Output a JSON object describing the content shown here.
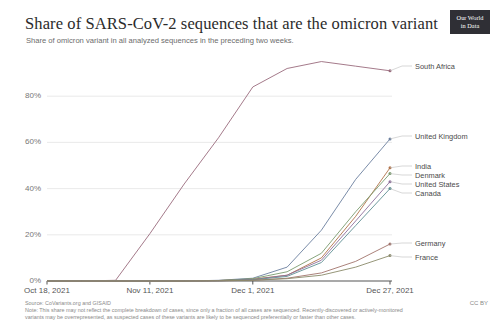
{
  "header": {
    "title": "Share of SARS-CoV-2 sequences that are the omicron variant",
    "subtitle": "Share of omicron variant in all analyzed sequences in the preceding two weeks.",
    "logo_line1": "Our World",
    "logo_line2": "in Data"
  },
  "footer": {
    "source": "Source: CoVariants.org and GISAID",
    "note": "Note: This share may not reflect the complete breakdown of cases, since only a fraction of all cases are sequenced. Recently-discovered or actively-monitored variants may be overrepresented, as suspected cases of these variants are likely to be sequenced preferentially or faster than other cases.",
    "license": "CC BY"
  },
  "chart_data": {
    "type": "line",
    "title": "Share of SARS-CoV-2 sequences that are the omicron variant",
    "subtitle": "Share of omicron variant in all analyzed sequences in the preceding two weeks.",
    "xlabel": "",
    "ylabel": "",
    "ylim": [
      0,
      100
    ],
    "yticks": [
      0,
      20,
      40,
      60,
      80
    ],
    "ytick_labels": [
      "0%",
      "20%",
      "40%",
      "60%",
      "80%"
    ],
    "grid": true,
    "legend_position": "right-inline",
    "x": [
      "Oct 18, 2021",
      "Oct 25, 2021",
      "Nov 1, 2021",
      "Nov 11, 2021",
      "Nov 18, 2021",
      "Nov 25, 2021",
      "Dec 1, 2021",
      "Dec 7, 2021",
      "Dec 13, 2021",
      "Dec 20, 2021",
      "Dec 27, 2021"
    ],
    "xtick_labels": [
      "Oct 18, 2021",
      "Nov 11, 2021",
      "Dec 1, 2021",
      "Dec 27, 2021"
    ],
    "xtick_positions": [
      0,
      3,
      6,
      10
    ],
    "series": [
      {
        "name": "South Africa",
        "color": "#9a6b7d",
        "values": [
          0,
          0,
          0.3,
          20.5,
          42,
          62,
          84,
          92,
          95,
          93,
          91
        ]
      },
      {
        "name": "United Kingdom",
        "color": "#6b7f9e",
        "values": [
          0,
          0,
          0,
          0,
          0,
          0.3,
          1.2,
          6,
          22,
          44,
          61.5
        ]
      },
      {
        "name": "India",
        "color": "#b0734a",
        "values": [
          0,
          0,
          0,
          0,
          0,
          0.2,
          0.8,
          2.5,
          10,
          28,
          49
        ]
      },
      {
        "name": "Denmark",
        "color": "#7a9b6e",
        "values": [
          0,
          0,
          0,
          0,
          0,
          0.2,
          1.0,
          4,
          12,
          30,
          46.5
        ]
      },
      {
        "name": "United States",
        "color": "#8e6f9c",
        "values": [
          0,
          0,
          0,
          0,
          0,
          0.1,
          0.6,
          2.5,
          9,
          26,
          43
        ]
      },
      {
        "name": "Canada",
        "color": "#5f8f93",
        "values": [
          0,
          0,
          0,
          0,
          0,
          0.1,
          0.5,
          2,
          8,
          24,
          40
        ]
      },
      {
        "name": "Germany",
        "color": "#a1746c",
        "values": [
          0,
          0,
          0,
          0,
          0,
          0.1,
          0.3,
          1.2,
          3.5,
          8.5,
          16
        ]
      },
      {
        "name": "France",
        "color": "#8a8a6a",
        "values": [
          0,
          0,
          0,
          0,
          0,
          0.1,
          0.3,
          1.0,
          2.5,
          6,
          11
        ]
      }
    ]
  }
}
